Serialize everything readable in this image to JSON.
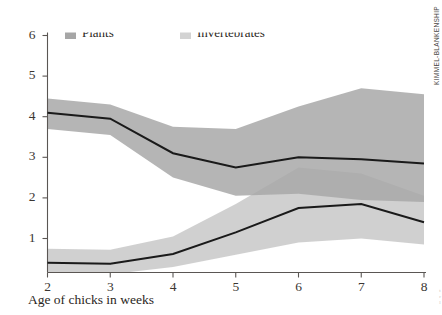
{
  "chart_data": {
    "type": "line",
    "title": "Food items eaten per minute",
    "xlabel": "Age of chicks in weeks",
    "ylabel": "",
    "x": [
      2,
      3,
      4,
      5,
      6,
      7,
      8
    ],
    "xlim": [
      2,
      8
    ],
    "ylim": [
      0,
      6
    ],
    "xticks": [
      "2",
      "3",
      "4",
      "5",
      "6",
      "7",
      "8"
    ],
    "yticks": [
      "1",
      "2",
      "3",
      "4",
      "5",
      "6"
    ],
    "grid": false,
    "legend_position": "top",
    "series": [
      {
        "name": "Plants",
        "color": "#1a1a1a",
        "band_color": "#a8a8a8",
        "values": [
          4.1,
          3.95,
          3.1,
          2.75,
          3.0,
          2.95,
          2.85
        ],
        "band_upper": [
          4.45,
          4.3,
          3.75,
          3.7,
          4.25,
          4.7,
          4.55
        ],
        "band_lower": [
          3.7,
          3.55,
          2.5,
          2.05,
          2.1,
          1.95,
          1.9
        ]
      },
      {
        "name": "Invertebrates",
        "color": "#1a1a1a",
        "band_color": "#c8c8c8",
        "values": [
          0.4,
          0.38,
          0.62,
          1.15,
          1.75,
          1.85,
          1.4
        ],
        "band_upper": [
          0.75,
          0.72,
          1.05,
          1.85,
          2.75,
          2.6,
          2.05
        ],
        "band_lower": [
          0.15,
          0.12,
          0.3,
          0.6,
          0.9,
          1.0,
          0.85
        ]
      }
    ]
  },
  "legend": {
    "items": [
      {
        "label": "Plants",
        "swatch_color": "#a6a6a6"
      },
      {
        "label": "Invertebrates",
        "swatch_color": "#d3d3d3"
      }
    ]
  },
  "credit": {
    "text": "KIMMEL-BLANKENSHIP"
  },
  "margin_bleed": {
    "text": "t\nr\nl"
  }
}
